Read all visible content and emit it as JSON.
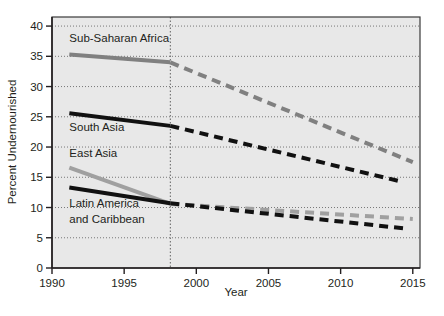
{
  "chart_data": {
    "type": "line",
    "title": "",
    "xlabel": "Year",
    "ylabel": "Percent Undernourished",
    "xlim": [
      1990,
      2015.5
    ],
    "ylim": [
      0,
      41.5
    ],
    "xticks": [
      1990,
      1995,
      2000,
      2005,
      2010,
      2015
    ],
    "xtick_labels": [
      "1990",
      "1995",
      "2000",
      "2005",
      "2010",
      "2015"
    ],
    "yticks": [
      0,
      5,
      10,
      15,
      20,
      25,
      30,
      35,
      40
    ],
    "ytick_labels": [
      "0",
      "5",
      "10",
      "15",
      "20",
      "25",
      "30",
      "35",
      "40"
    ],
    "grid": "horizontal-dotted",
    "plot_background": "#e8e8e8",
    "divider_line": {
      "x": 1998.2,
      "style": "dotted",
      "color": "#555555"
    },
    "legend_position": "inline-labels",
    "series": [
      {
        "name": "Sub-Saharan Africa",
        "color": "#808080",
        "label": "Sub-Saharan Africa",
        "label_x": 1991.2,
        "label_y": 37.4,
        "solid_segment": {
          "x": [
            1991.2,
            1998.2
          ],
          "y": [
            35.3,
            34.0
          ]
        },
        "dashed_segment": {
          "x": [
            1998.2,
            2015.0
          ],
          "y": [
            34.0,
            17.5
          ]
        }
      },
      {
        "name": "South Asia",
        "color": "#111111",
        "label": "South Asia",
        "label_x": 1991.2,
        "label_y": 22.7,
        "solid_segment": {
          "x": [
            1991.2,
            1998.2
          ],
          "y": [
            25.6,
            23.5
          ]
        },
        "dashed_segment": {
          "x": [
            1998.2,
            2014.0
          ],
          "y": [
            23.5,
            14.4
          ]
        }
      },
      {
        "name": "East Asia",
        "color": "#a0a0a0",
        "label": "East Asia",
        "label_x": 1991.2,
        "label_y": 18.4,
        "solid_segment": {
          "x": [
            1991.2,
            1998.2
          ],
          "y": [
            16.6,
            10.6
          ]
        },
        "dashed_segment": {
          "x": [
            1998.2,
            2015.0
          ],
          "y": [
            10.6,
            8.1
          ]
        }
      },
      {
        "name": "Latin America and Caribbean",
        "color": "#111111",
        "label_line_1": "Latin America",
        "label_line_2": "and Caribbean",
        "label_x": 1991.2,
        "label_y": 10.1,
        "solid_segment": {
          "x": [
            1991.2,
            1998.2
          ],
          "y": [
            13.3,
            10.7
          ]
        },
        "dashed_segment": {
          "x": [
            1998.2,
            2014.6
          ],
          "y": [
            10.7,
            6.5
          ]
        }
      }
    ]
  }
}
